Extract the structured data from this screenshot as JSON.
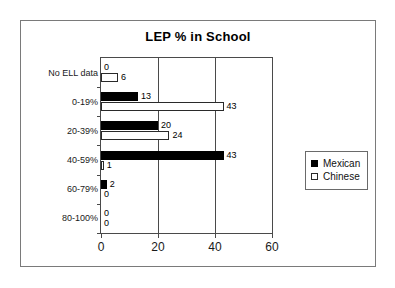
{
  "chart_data": {
    "type": "bar",
    "orientation": "horizontal",
    "title": "LEP % in School",
    "xlabel": "",
    "ylabel": "",
    "xlim": [
      0,
      60
    ],
    "xticks": [
      0,
      20,
      40,
      60
    ],
    "xtick_labels": [
      "0",
      "20",
      "40",
      "60"
    ],
    "grid": true,
    "grid_axis": "x",
    "legend_position": "right",
    "categories": [
      "No ELL data",
      "0-19%",
      "20-39%",
      "40-59%",
      "60-79%",
      "80-100%"
    ],
    "series": [
      {
        "name": "Mexican",
        "color": "#000000",
        "values": [
          0,
          13,
          20,
          43,
          2,
          0
        ],
        "labels": [
          "0",
          "13",
          "20",
          "43",
          "2",
          "0"
        ]
      },
      {
        "name": "Chinese",
        "color": "#ffffff",
        "values": [
          6,
          43,
          24,
          1,
          0,
          0
        ],
        "labels": [
          "6",
          "43",
          "24",
          "1",
          "0",
          "0"
        ]
      }
    ]
  },
  "legend": {
    "entries": [
      {
        "label": "Mexican",
        "swatch": "filled-black-square"
      },
      {
        "label": "Chinese",
        "swatch": "open-white-square"
      }
    ]
  }
}
